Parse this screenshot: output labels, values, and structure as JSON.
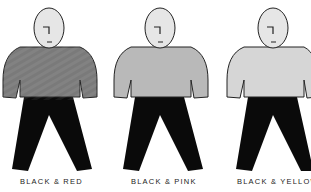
{
  "figures": [
    {
      "label": "BLACK & RED",
      "shirt_color": "#7a7a7a",
      "pants_color": "#0a0a0a",
      "head_color": "#e6e6e6"
    },
    {
      "label": "BLACK & PINK",
      "shirt_color": "#b9b9b9",
      "pants_color": "#0a0a0a",
      "head_color": "#e6e6e6"
    },
    {
      "label": "BLACK & YELLOW",
      "shirt_color": "#d6d6d6",
      "pants_color": "#0a0a0a",
      "head_color": "#e6e6e6"
    }
  ]
}
